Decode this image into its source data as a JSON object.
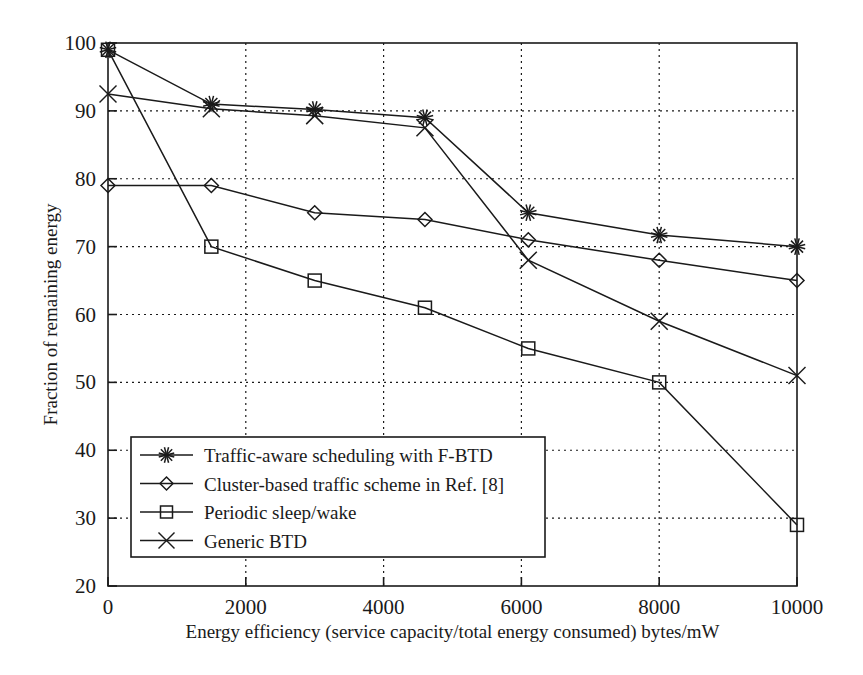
{
  "chart_data": {
    "type": "line",
    "title": "",
    "xlabel": "Energy efficiency (service capacity/total energy consumed) bytes/mW",
    "ylabel": "Fraction of remaining energy",
    "xlim": [
      0,
      10000
    ],
    "ylim": [
      20,
      100
    ],
    "xticks": [
      "0",
      "2000",
      "4000",
      "6000",
      "8000",
      "10000"
    ],
    "xtick_values": [
      0,
      2000,
      4000,
      6000,
      8000,
      10000
    ],
    "yticks": [
      "20",
      "30",
      "40",
      "50",
      "60",
      "70",
      "80",
      "90",
      "100"
    ],
    "ytick_values": [
      20,
      30,
      40,
      50,
      60,
      70,
      80,
      90,
      100
    ],
    "grid": true,
    "grid_style": "dotted",
    "legend_position": "lower-left",
    "line_color": "#1a1a1a",
    "series": [
      {
        "name": "Traffic-aware scheduling with F-BTD",
        "marker": "asterisk",
        "x": [
          0,
          1500,
          3000,
          4600,
          6100,
          8000,
          10000
        ],
        "values": [
          99,
          91,
          90.2,
          89,
          75,
          71.7,
          70
        ]
      },
      {
        "name": "Cluster-based traffic scheme in Ref. [8]",
        "marker": "diamond",
        "x": [
          0,
          1500,
          3000,
          4600,
          6100,
          8000,
          10000
        ],
        "values": [
          79,
          79,
          75,
          74,
          71,
          68,
          65
        ]
      },
      {
        "name": "Periodic sleep/wake",
        "marker": "square",
        "x": [
          0,
          1500,
          3000,
          4600,
          6100,
          8000,
          10000
        ],
        "values": [
          99,
          70,
          65,
          61,
          55,
          50,
          29
        ]
      },
      {
        "name": "Generic BTD",
        "marker": "x-cross",
        "x": [
          0,
          1500,
          3000,
          4600,
          6100,
          8000,
          10000
        ],
        "values": [
          92.5,
          90.3,
          89.3,
          87.5,
          68,
          59,
          51
        ]
      }
    ]
  },
  "legend": {
    "entries": [
      {
        "label": "Traffic-aware scheduling with F-BTD",
        "marker": "asterisk-marker-icon"
      },
      {
        "label": "Cluster-based traffic scheme in Ref. [8]",
        "marker": "diamond-marker-icon"
      },
      {
        "label": "Periodic sleep/wake",
        "marker": "square-marker-icon"
      },
      {
        "label": "Generic BTD",
        "marker": "x-cross-marker-icon"
      }
    ]
  }
}
